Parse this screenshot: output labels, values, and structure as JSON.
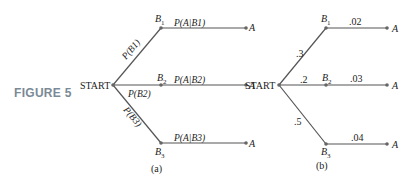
{
  "figure_label": "FIGURE 5",
  "diagram_a": {
    "caption": "(a)",
    "root": "START",
    "branches": [
      {
        "node": "B1",
        "node_base": "B",
        "node_sub": "1",
        "edge_label": "P(B1)",
        "cond_label": "P(A|B1)",
        "leaf": "A"
      },
      {
        "node": "B2",
        "node_base": "B",
        "node_sub": "2",
        "edge_label": "P(B2)",
        "cond_label": "P(A|B2)",
        "leaf": "A"
      },
      {
        "node": "B3",
        "node_base": "B",
        "node_sub": "3",
        "edge_label": "P(B3)",
        "cond_label": "P(A|B3)",
        "leaf": "A"
      }
    ]
  },
  "diagram_b": {
    "caption": "(b)",
    "root": "START",
    "branches": [
      {
        "node": "B1",
        "node_base": "B",
        "node_sub": "1",
        "edge_label": ".3",
        "cond_label": ".02",
        "leaf": "A"
      },
      {
        "node": "B2",
        "node_base": "B",
        "node_sub": "2",
        "edge_label": ".2",
        "cond_label": ".03",
        "leaf": "A"
      },
      {
        "node": "B3",
        "node_base": "B",
        "node_sub": "3",
        "edge_label": ".5",
        "cond_label": ".04",
        "leaf": "A"
      }
    ]
  }
}
